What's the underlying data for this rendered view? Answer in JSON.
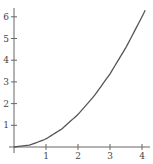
{
  "chart_data": {
    "type": "line",
    "title": "",
    "xlabel": "",
    "ylabel": "",
    "xlim": [
      0,
      4.15
    ],
    "ylim": [
      0,
      6.4
    ],
    "x_ticks": [
      1,
      2,
      3,
      4
    ],
    "y_ticks": [
      1,
      2,
      3,
      4,
      5,
      6
    ],
    "x_tick_labels": [
      "1",
      "2",
      "3",
      "4"
    ],
    "y_tick_labels": [
      "1",
      "2",
      "3",
      "4",
      "5",
      "6"
    ],
    "grid": false,
    "legend": null,
    "series": [
      {
        "name": "curve",
        "x": [
          0,
          0.5,
          1,
          1.5,
          2,
          2.5,
          3,
          3.5,
          4,
          4.1
        ],
        "y": [
          0,
          0.09,
          0.37,
          0.84,
          1.5,
          2.34,
          3.37,
          4.59,
          6.0,
          6.3
        ]
      }
    ],
    "colors": {
      "curve": "#555555",
      "axis": "#666666"
    }
  }
}
